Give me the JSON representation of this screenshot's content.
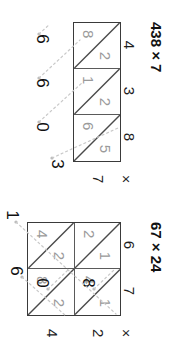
{
  "page": {
    "kind": "lattice-multiplication-worksheet",
    "orientation": "rotated-90"
  },
  "problems": [
    {
      "id": "problem-1",
      "title": "438 × 7",
      "multiplicand": "438",
      "multiplier": "7",
      "top_digits": [
        "4",
        "3",
        "8"
      ],
      "side_digits": [
        "7"
      ],
      "times_symbol": "×",
      "columns": 3,
      "rows": 1,
      "cells": [
        {
          "row": 0,
          "col": 0,
          "tens": "2",
          "ones": "8",
          "product": "28"
        },
        {
          "row": 0,
          "col": 1,
          "tens": "2",
          "ones": "1",
          "product": "21"
        },
        {
          "row": 0,
          "col": 2,
          "tens": "5",
          "ones": "6",
          "product": "56"
        }
      ],
      "answer": "3066",
      "answer_digits": [
        "3",
        "0",
        "6",
        "6"
      ]
    },
    {
      "id": "problem-2",
      "title": "67 × 24",
      "multiplicand": "67",
      "multiplier": "24",
      "top_digits": [
        "6",
        "7"
      ],
      "side_digits": [
        "2",
        "4"
      ],
      "times_symbol": "×",
      "columns": 2,
      "rows": 2,
      "cells": [
        {
          "row": 0,
          "col": 0,
          "tens": "1",
          "ones": "2",
          "product": "12"
        },
        {
          "row": 0,
          "col": 1,
          "tens": "1",
          "ones": "4",
          "product": "14"
        },
        {
          "row": 1,
          "col": 0,
          "tens": "2",
          "ones": "4",
          "product": "24"
        },
        {
          "row": 1,
          "col": 1,
          "tens": "2",
          "ones": "8",
          "product": "28"
        }
      ],
      "answer": "1608",
      "answer_digits": [
        "1",
        "6",
        "0",
        "8"
      ]
    }
  ]
}
